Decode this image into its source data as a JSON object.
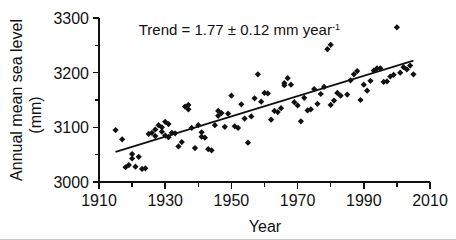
{
  "chart_data": {
    "type": "scatter",
    "title": "",
    "xlabel": "Year",
    "ylabel": "Annual mean sea level (mm)",
    "ylabel_line1": "Annual mean sea level",
    "ylabel_line2": "(mm)",
    "xlim": [
      1910,
      2010
    ],
    "ylim": [
      3000,
      3300
    ],
    "grid": false,
    "legend": "none",
    "x_ticks_major": [
      1910,
      1930,
      1950,
      1970,
      1990,
      2010
    ],
    "x_ticks_minor": [
      1920,
      1940,
      1960,
      1980,
      2000
    ],
    "y_ticks_major": [
      3000,
      3100,
      3200,
      3300
    ],
    "y_ticks_minor": [
      3050,
      3150,
      3250
    ],
    "x_tick_labels": [
      "1910",
      "1930",
      "1950",
      "1970",
      "1990",
      "2010"
    ],
    "y_tick_labels": [
      "3000",
      "3100",
      "3200",
      "3300"
    ],
    "annotation": {
      "text_main": "Trend = 1.77 ± 0.12 mm year",
      "text_sup": "-1",
      "full_text": "Trend = 1.77 ± 0.12 mm year-1",
      "x": 1922,
      "y": 3268
    },
    "trend": {
      "slope_mm_per_year": 1.77,
      "uncertainty_mm_per_year": 0.12,
      "units": "mm year-1",
      "x_start": 1915,
      "y_start": 3055,
      "x_end": 2005,
      "y_end": 3222
    },
    "marker": "diamond",
    "marker_color": "#111111",
    "series": [
      {
        "name": "Annual mean sea level",
        "x": [
          1915,
          1917,
          1918,
          1919,
          1920,
          1920,
          1921,
          1922,
          1923,
          1924,
          1925,
          1926,
          1927,
          1927,
          1928,
          1929,
          1929,
          1930,
          1930,
          1931,
          1931,
          1932,
          1933,
          1934,
          1935,
          1936,
          1937,
          1937,
          1938,
          1939,
          1940,
          1941,
          1941,
          1942,
          1943,
          1944,
          1945,
          1946,
          1946,
          1947,
          1948,
          1949,
          1950,
          1951,
          1952,
          1953,
          1954,
          1955,
          1956,
          1957,
          1958,
          1959,
          1960,
          1961,
          1962,
          1963,
          1964,
          1965,
          1966,
          1966,
          1967,
          1968,
          1969,
          1970,
          1971,
          1972,
          1973,
          1974,
          1975,
          1976,
          1977,
          1978,
          1979,
          1980,
          1980,
          1981,
          1982,
          1983,
          1985,
          1986,
          1987,
          1988,
          1989,
          1990,
          1991,
          1992,
          1993,
          1994,
          1995,
          1996,
          1997,
          1998,
          1999,
          2000,
          2001,
          2002,
          2003,
          2004,
          2005
        ],
        "y": [
          3095,
          3078,
          3027,
          3031,
          3043,
          3051,
          3028,
          3046,
          3024,
          3025,
          3088,
          3090,
          3096,
          3084,
          3104,
          3100,
          3092,
          3110,
          3085,
          3106,
          3082,
          3090,
          3089,
          3065,
          3073,
          3138,
          3141,
          3133,
          3099,
          3062,
          3104,
          3091,
          3083,
          3081,
          3060,
          3058,
          3104,
          3130,
          3121,
          3126,
          3101,
          3125,
          3158,
          3102,
          3099,
          3142,
          3116,
          3072,
          3120,
          3153,
          3197,
          3147,
          3163,
          3162,
          3114,
          3130,
          3128,
          3135,
          3181,
          3177,
          3190,
          3178,
          3146,
          3140,
          3111,
          3154,
          3131,
          3133,
          3170,
          3143,
          3161,
          3174,
          3243,
          3251,
          3141,
          3149,
          3163,
          3158,
          3160,
          3186,
          3197,
          3203,
          3150,
          3178,
          3167,
          3185,
          3204,
          3208,
          3208,
          3183,
          3184,
          3193,
          3196,
          3283,
          3200,
          3210,
          3206,
          3213,
          3197
        ]
      }
    ]
  },
  "figure": {
    "plot_left_px": 99,
    "plot_right_px": 430,
    "plot_top_px": 18,
    "plot_bottom_px": 182
  }
}
